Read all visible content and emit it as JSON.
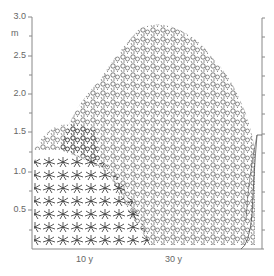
{
  "figure": {
    "type": "vegetation profile illustration",
    "y_axis": {
      "unit": "m",
      "ticks": [
        {
          "label": "3.0",
          "value": 3.0
        },
        {
          "label": "2.5",
          "value": 2.5
        },
        {
          "label": "2.0",
          "value": 2.0
        },
        {
          "label": "1.5",
          "value": 1.5
        },
        {
          "label": "1.0",
          "value": 1.0
        },
        {
          "label": "0.5",
          "value": 0.5
        }
      ],
      "range": [
        0,
        3.0
      ],
      "minor_tick_step": 0.25
    },
    "x_axis": {
      "labels": [
        {
          "label": "10 y"
        },
        {
          "label": "30 y"
        }
      ]
    },
    "right_axis": {
      "range": [
        0,
        3.0
      ],
      "tick_step": 0.25,
      "bracket_top_value": 1.5
    },
    "colors": {
      "axis": "#888888",
      "ink": "#222222",
      "background": "#ffffff"
    }
  }
}
